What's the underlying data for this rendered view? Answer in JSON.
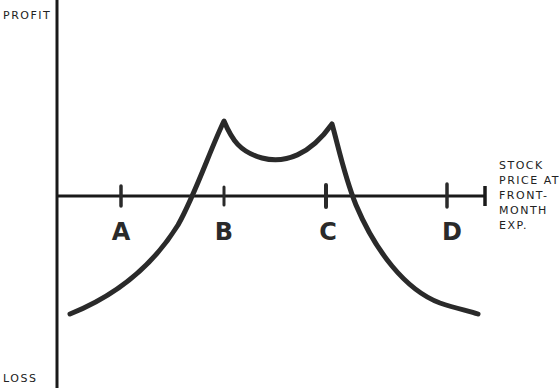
{
  "diagram": {
    "type": "options-payoff-diagram",
    "y_axis": {
      "top_label": "PROFIT",
      "bottom_label": "LOSS"
    },
    "x_axis": {
      "label_lines": [
        "STOCK",
        "PRICE AT",
        "FRONT-",
        "MONTH",
        "EXP."
      ]
    },
    "strike_points": [
      {
        "label": "A",
        "x": 121
      },
      {
        "label": "B",
        "x": 224
      },
      {
        "label": "C",
        "x": 326
      },
      {
        "label": "D",
        "x": 447
      }
    ],
    "curve": {
      "description": "Payoff curve rising from loss at left, two peaks at strikes B and C with a shallow dip between them, falling back to loss at right",
      "color": "#2a2a2a"
    },
    "colors": {
      "ink": "#2a2a2a",
      "axis": "#1a1a1a",
      "background": "#ffffff"
    }
  }
}
